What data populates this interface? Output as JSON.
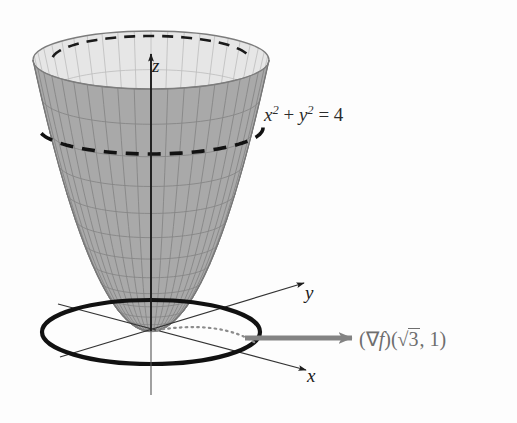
{
  "figure": {
    "background_color": "#fdfdfd"
  },
  "labels": {
    "z_axis": "z",
    "y_axis": "y",
    "x_axis": "x",
    "level_curve_equation": {
      "full_text": "x2 + y2 = 4",
      "base_x": "x",
      "exp_x": "2",
      "plus": "+",
      "base_y": "y",
      "exp_y": "2",
      "equals": "=",
      "value": "4"
    },
    "gradient_vector": {
      "full_text": "(∇f)(√3, 1)",
      "open_paren": "(",
      "nabla": "∇",
      "f": "f",
      "close_paren": ")",
      "arg_open": "(",
      "radical": "√",
      "radicand": "3",
      "comma": ",",
      "second_arg": "1",
      "arg_close": ")"
    }
  },
  "colors": {
    "surface_outer": "#a9a9a9",
    "surface_inner": "#e4e4e4",
    "surface_rim_band": "#f2f2f2",
    "grid_line": "#8a8a8a",
    "grid_line_inner": "#b9b9b9",
    "outline": "#7c7c7c",
    "axis": "#2a2a2a",
    "level_curve": "#111111",
    "gradient_arrow": "#808080",
    "dotted_radius": "#8c8c8c",
    "text": "#2b2b2b"
  },
  "geometry": {
    "origin": {
      "x": 151,
      "y": 331
    },
    "rim": {
      "cx": 151,
      "cy": 60,
      "rx": 118,
      "ry": 29
    },
    "base_ellipse": {
      "cx": 151,
      "cy": 332,
      "rx": 109,
      "ry": 32
    },
    "level_curve_dashed": {
      "cx": 151,
      "cy": 128,
      "rx": 112,
      "ry": 26
    },
    "rim_back_dashed": {
      "cx": 151,
      "cy": 60,
      "rx": 99,
      "ry": 24
    },
    "paraboloid": {
      "height_px": 271,
      "top_rx": 118,
      "top_ry": 29,
      "u_segments": 22,
      "v_segments": 14
    },
    "z_axis_arrow": {
      "x1": 151,
      "y1": 331,
      "x2": 151,
      "y2": 54
    },
    "y_axis_arrow": {
      "x1": 60,
      "y1": 357,
      "x2": 304,
      "y2": 283
    },
    "x_axis_arrow": {
      "x1": 58,
      "y1": 304,
      "x2": 306,
      "y2": 370
    },
    "gradient_arrow": {
      "x1": 245,
      "y1": 338,
      "x2": 352,
      "y2": 338,
      "width": 5
    },
    "dotted_radius_arc": {
      "from_x": 151,
      "from_y": 331,
      "to_x": 257,
      "to_y": 344
    }
  },
  "chart_data": {
    "type": "surface-3d",
    "surface_equation": "z = x^2 + y^2",
    "level_curve": {
      "equation": "x^2 + y^2 = 4",
      "z_value": 4,
      "radius": 2
    },
    "gradient_point": {
      "x": 1.7320508,
      "y": 1,
      "label": "(√3, 1)"
    },
    "gradient_vector_value": {
      "dx": 3.4641016,
      "dy": 2
    },
    "axes": [
      "x",
      "y",
      "z"
    ]
  }
}
